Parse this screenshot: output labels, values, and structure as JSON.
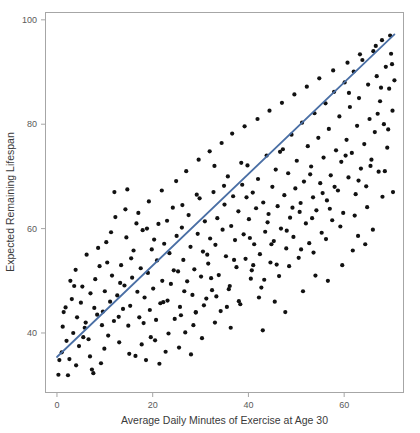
{
  "chart_data": {
    "type": "scatter",
    "title": "",
    "xlabel": "Average Daily Minutes of Exercise at Age 30",
    "ylabel": "Expected Remaining Lifespan",
    "xlim": [
      -2.5,
      72.5
    ],
    "ylim": [
      28.5,
      101.5
    ],
    "xticks": [
      0,
      20,
      40,
      60
    ],
    "xtick_labels": [
      "0",
      "20",
      "40",
      "60"
    ],
    "yticks": [
      40,
      60,
      80,
      100
    ],
    "ytick_labels": [
      "40",
      "60",
      "80",
      "100"
    ],
    "grid": false,
    "legend": null,
    "point_color": "#111111",
    "point_radius": 2.1,
    "trend": {
      "type": "line",
      "name": "linear fit",
      "color": "#4a6fa5",
      "x_start": 0.0,
      "x_end": 70.5,
      "y_start": 35.4,
      "y_end": 97.2,
      "slope": 0.877,
      "intercept": 35.4
    },
    "series": [
      {
        "name": "individuals",
        "n": 300,
        "points": [
          [
            0.3,
            32.0
          ],
          [
            0.5,
            34.8
          ],
          [
            1.0,
            36.3
          ],
          [
            1.2,
            41.2
          ],
          [
            1.4,
            44.0
          ],
          [
            1.8,
            44.9
          ],
          [
            2.3,
            31.9
          ],
          [
            2.6,
            35.0
          ],
          [
            3.1,
            46.5
          ],
          [
            3.4,
            40.0
          ],
          [
            3.9,
            52.1
          ],
          [
            4.2,
            43.0
          ],
          [
            4.6,
            37.5
          ],
          [
            5.0,
            45.8
          ],
          [
            5.3,
            48.9
          ],
          [
            5.8,
            41.0
          ],
          [
            6.2,
            55.0
          ],
          [
            6.6,
            38.8
          ],
          [
            7.0,
            47.6
          ],
          [
            7.3,
            33.0
          ],
          [
            7.6,
            32.3
          ],
          [
            8.0,
            50.3
          ],
          [
            8.4,
            43.5
          ],
          [
            8.9,
            52.8
          ],
          [
            9.2,
            34.2
          ],
          [
            9.6,
            44.1
          ],
          [
            10.0,
            48.0
          ],
          [
            10.3,
            57.4
          ],
          [
            10.7,
            39.5
          ],
          [
            11.1,
            46.0
          ],
          [
            11.5,
            51.0
          ],
          [
            11.9,
            42.3
          ],
          [
            12.2,
            62.2
          ],
          [
            12.6,
            47.2
          ],
          [
            13.0,
            38.2
          ],
          [
            13.4,
            53.0
          ],
          [
            13.8,
            44.6
          ],
          [
            14.1,
            49.1
          ],
          [
            14.5,
            58.3
          ],
          [
            14.9,
            41.4
          ],
          [
            15.3,
            45.2
          ],
          [
            15.7,
            50.6
          ],
          [
            16.0,
            55.8
          ],
          [
            16.4,
            35.6
          ],
          [
            16.8,
            47.9
          ],
          [
            17.2,
            43.0
          ],
          [
            17.5,
            52.4
          ],
          [
            17.9,
            59.7
          ],
          [
            18.3,
            46.8
          ],
          [
            18.6,
            34.8
          ],
          [
            19.0,
            51.5
          ],
          [
            19.4,
            44.4
          ],
          [
            19.8,
            56.0
          ],
          [
            20.1,
            48.5
          ],
          [
            20.5,
            38.6
          ],
          [
            20.9,
            53.9
          ],
          [
            21.2,
            60.9
          ],
          [
            21.6,
            45.7
          ],
          [
            22.0,
            50.0
          ],
          [
            22.4,
            57.1
          ],
          [
            22.7,
            36.4
          ],
          [
            23.1,
            46.2
          ],
          [
            23.5,
            55.3
          ],
          [
            23.8,
            49.4
          ],
          [
            24.2,
            64.0
          ],
          [
            24.6,
            42.7
          ],
          [
            25.0,
            58.6
          ],
          [
            25.3,
            51.8
          ],
          [
            25.7,
            45.0
          ],
          [
            26.1,
            60.2
          ],
          [
            26.4,
            54.0
          ],
          [
            26.8,
            40.1
          ],
          [
            27.2,
            49.9
          ],
          [
            27.5,
            62.6
          ],
          [
            27.9,
            56.5
          ],
          [
            28.3,
            47.3
          ],
          [
            28.7,
            52.2
          ],
          [
            29.0,
            43.9
          ],
          [
            29.4,
            59.0
          ],
          [
            29.8,
            65.8
          ],
          [
            30.1,
            50.8
          ],
          [
            30.5,
            55.6
          ],
          [
            30.9,
            61.4
          ],
          [
            31.2,
            46.6
          ],
          [
            31.6,
            53.3
          ],
          [
            32.0,
            58.1
          ],
          [
            32.4,
            48.2
          ],
          [
            32.7,
            67.0
          ],
          [
            33.1,
            56.9
          ],
          [
            33.5,
            62.0
          ],
          [
            33.8,
            51.1
          ],
          [
            34.2,
            44.2
          ],
          [
            34.6,
            59.8
          ],
          [
            35.0,
            64.6
          ],
          [
            35.3,
            54.7
          ],
          [
            35.7,
            70.0
          ],
          [
            36.1,
            49.0
          ],
          [
            36.4,
            60.5
          ],
          [
            36.8,
            66.2
          ],
          [
            37.2,
            57.8
          ],
          [
            37.5,
            52.6
          ],
          [
            37.9,
            63.3
          ],
          [
            38.3,
            45.5
          ],
          [
            38.7,
            68.4
          ],
          [
            39.0,
            58.9
          ],
          [
            39.4,
            54.2
          ],
          [
            39.8,
            72.1
          ],
          [
            40.1,
            61.8
          ],
          [
            40.5,
            50.4
          ],
          [
            40.9,
            66.9
          ],
          [
            41.2,
            57.0
          ],
          [
            41.6,
            63.9
          ],
          [
            42.0,
            69.5
          ],
          [
            42.4,
            55.1
          ],
          [
            42.7,
            48.7
          ],
          [
            43.1,
            65.0
          ],
          [
            43.5,
            59.4
          ],
          [
            43.8,
            74.0
          ],
          [
            44.2,
            62.8
          ],
          [
            44.6,
            53.5
          ],
          [
            45.0,
            68.0
          ],
          [
            45.3,
            57.6
          ],
          [
            45.7,
            71.3
          ],
          [
            46.1,
            64.3
          ],
          [
            46.4,
            50.9
          ],
          [
            46.8,
            60.0
          ],
          [
            47.2,
            75.2
          ],
          [
            47.5,
            66.4
          ],
          [
            47.9,
            56.2
          ],
          [
            48.3,
            70.6
          ],
          [
            48.7,
            62.1
          ],
          [
            49.0,
            78.0
          ],
          [
            49.4,
            58.4
          ],
          [
            49.8,
            67.7
          ],
          [
            50.1,
            73.0
          ],
          [
            50.5,
            54.4
          ],
          [
            50.9,
            64.9
          ],
          [
            51.2,
            80.3
          ],
          [
            51.6,
            69.0
          ],
          [
            52.0,
            61.0
          ],
          [
            52.4,
            75.8
          ],
          [
            52.7,
            57.2
          ],
          [
            53.1,
            71.9
          ],
          [
            53.5,
            66.0
          ],
          [
            53.8,
            82.1
          ],
          [
            54.2,
            63.5
          ],
          [
            54.6,
            77.4
          ],
          [
            55.0,
            68.7
          ],
          [
            55.3,
            59.2
          ],
          [
            55.7,
            73.6
          ],
          [
            56.1,
            84.0
          ],
          [
            56.4,
            65.4
          ],
          [
            56.8,
            79.1
          ],
          [
            57.2,
            70.2
          ],
          [
            57.5,
            61.6
          ],
          [
            57.9,
            86.2
          ],
          [
            58.3,
            75.0
          ],
          [
            58.7,
            67.3
          ],
          [
            59.0,
            81.5
          ],
          [
            59.4,
            72.8
          ],
          [
            59.8,
            63.0
          ],
          [
            60.1,
            88.0
          ],
          [
            60.5,
            77.0
          ],
          [
            60.9,
            69.8
          ],
          [
            61.2,
            83.3
          ],
          [
            61.6,
            74.5
          ],
          [
            62.0,
            90.1
          ],
          [
            62.4,
            66.6
          ],
          [
            62.7,
            79.7
          ],
          [
            63.1,
            85.0
          ],
          [
            63.5,
            71.5
          ],
          [
            63.8,
            92.3
          ],
          [
            64.2,
            76.2
          ],
          [
            64.6,
            68.1
          ],
          [
            65.0,
            87.6
          ],
          [
            65.3,
            81.0
          ],
          [
            65.7,
            73.2
          ],
          [
            66.1,
            94.0
          ],
          [
            66.4,
            78.5
          ],
          [
            66.8,
            89.2
          ],
          [
            67.2,
            70.9
          ],
          [
            67.5,
            84.4
          ],
          [
            67.9,
            96.1
          ],
          [
            68.3,
            80.0
          ],
          [
            68.7,
            91.0
          ],
          [
            69.0,
            75.5
          ],
          [
            69.4,
            86.8
          ],
          [
            69.8,
            93.5
          ],
          [
            70.1,
            82.6
          ],
          [
            70.5,
            88.4
          ],
          [
            2.0,
            38.5
          ],
          [
            4.0,
            33.8
          ],
          [
            6.0,
            42.0
          ],
          [
            8.6,
            56.3
          ],
          [
            9.9,
            37.0
          ],
          [
            11.3,
            59.3
          ],
          [
            12.9,
            43.1
          ],
          [
            14.3,
            63.7
          ],
          [
            15.1,
            36.0
          ],
          [
            16.6,
            61.0
          ],
          [
            18.1,
            41.9
          ],
          [
            19.2,
            65.2
          ],
          [
            20.7,
            42.5
          ],
          [
            21.9,
            67.3
          ],
          [
            23.3,
            39.9
          ],
          [
            24.9,
            69.1
          ],
          [
            25.9,
            43.4
          ],
          [
            27.0,
            71.0
          ],
          [
            28.5,
            41.5
          ],
          [
            29.6,
            73.2
          ],
          [
            30.7,
            45.3
          ],
          [
            31.9,
            74.8
          ],
          [
            33.3,
            47.0
          ],
          [
            34.4,
            76.4
          ],
          [
            35.9,
            48.4
          ],
          [
            36.6,
            78.2
          ],
          [
            38.0,
            46.1
          ],
          [
            39.2,
            79.6
          ],
          [
            40.7,
            52.0
          ],
          [
            41.9,
            81.0
          ],
          [
            43.3,
            50.2
          ],
          [
            44.4,
            82.6
          ],
          [
            45.9,
            53.1
          ],
          [
            47.0,
            84.1
          ],
          [
            48.5,
            52.8
          ],
          [
            49.6,
            85.7
          ],
          [
            51.0,
            56.0
          ],
          [
            52.2,
            87.2
          ],
          [
            53.6,
            55.4
          ],
          [
            54.8,
            88.8
          ],
          [
            56.2,
            58.0
          ],
          [
            57.7,
            90.3
          ],
          [
            59.2,
            60.4
          ],
          [
            60.7,
            91.8
          ],
          [
            62.2,
            62.5
          ],
          [
            63.3,
            93.4
          ],
          [
            64.8,
            64.1
          ],
          [
            66.6,
            95.0
          ],
          [
            68.0,
            66.1
          ],
          [
            69.6,
            97.0
          ],
          [
            3.6,
            49.0
          ],
          [
            5.5,
            39.2
          ],
          [
            7.8,
            44.8
          ],
          [
            10.5,
            53.5
          ],
          [
            13.2,
            49.6
          ],
          [
            15.5,
            54.3
          ],
          [
            17.7,
            37.8
          ],
          [
            20.3,
            57.9
          ],
          [
            22.2,
            45.9
          ],
          [
            24.4,
            52.0
          ],
          [
            26.6,
            48.0
          ],
          [
            29.2,
            66.5
          ],
          [
            31.4,
            55.0
          ],
          [
            33.0,
            42.0
          ],
          [
            34.9,
            68.2
          ],
          [
            37.0,
            54.0
          ],
          [
            38.5,
            72.6
          ],
          [
            40.3,
            58.2
          ],
          [
            42.2,
            46.8
          ],
          [
            44.0,
            61.2
          ],
          [
            46.6,
            74.7
          ],
          [
            48.0,
            59.6
          ],
          [
            50.7,
            63.2
          ],
          [
            52.9,
            70.4
          ],
          [
            55.5,
            66.8
          ],
          [
            58.0,
            68.0
          ],
          [
            60.3,
            74.0
          ],
          [
            61.8,
            55.8
          ],
          [
            63.0,
            69.2
          ],
          [
            65.5,
            72.0
          ],
          [
            67.7,
            87.0
          ],
          [
            69.2,
            79.0
          ],
          [
            12.0,
            67.0
          ],
          [
            18.8,
            60.0
          ],
          [
            21.4,
            34.1
          ],
          [
            25.5,
            37.2
          ],
          [
            28.0,
            35.9
          ],
          [
            30.3,
            39.0
          ],
          [
            32.2,
            50.5
          ],
          [
            36.3,
            41.0
          ],
          [
            39.6,
            66.0
          ],
          [
            43.0,
            40.5
          ],
          [
            45.5,
            46.0
          ],
          [
            47.7,
            44.0
          ],
          [
            51.4,
            48.0
          ],
          [
            54.0,
            51.0
          ],
          [
            56.6,
            50.0
          ],
          [
            59.6,
            53.0
          ],
          [
            62.9,
            58.6
          ],
          [
            66.0,
            59.8
          ],
          [
            68.5,
            71.0
          ],
          [
            70.2,
            67.0
          ],
          [
            2.8,
            50.0
          ],
          [
            6.9,
            35.5
          ],
          [
            9.4,
            41.5
          ],
          [
            14.7,
            67.5
          ],
          [
            17.0,
            63.0
          ],
          [
            19.6,
            39.2
          ],
          [
            23.0,
            61.5
          ],
          [
            26.2,
            64.5
          ],
          [
            29.0,
            44.0
          ],
          [
            32.9,
            72.0
          ],
          [
            35.5,
            45.0
          ],
          [
            41.0,
            53.0
          ],
          [
            44.8,
            57.0
          ],
          [
            49.2,
            64.0
          ],
          [
            53.3,
            62.0
          ],
          [
            57.0,
            63.8
          ],
          [
            61.0,
            86.0
          ],
          [
            64.4,
            57.0
          ],
          [
            67.0,
            82.0
          ],
          [
            70.0,
            91.5
          ]
        ]
      }
    ]
  },
  "axis": {
    "x_title": "Average Daily Minutes of Exercise at Age 30",
    "y_title": "Expected Remaining Lifespan"
  }
}
